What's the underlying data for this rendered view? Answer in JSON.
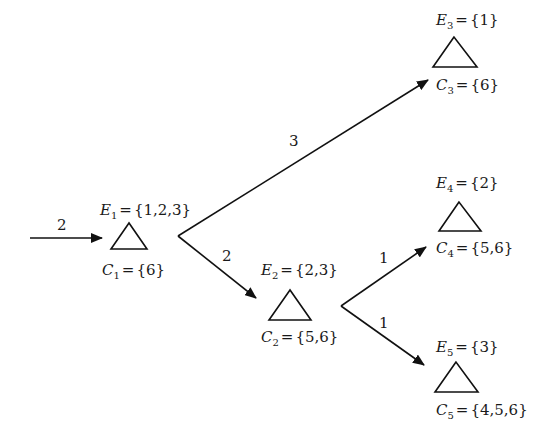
{
  "diagram": {
    "type": "tree",
    "input_edge": {
      "label": "2"
    },
    "nodes": [
      {
        "id": "n1",
        "E_var": "E",
        "E_sub": "1",
        "E_set": "{1,2,3}",
        "C_var": "C",
        "C_sub": "1",
        "C_set": "{6}"
      },
      {
        "id": "n2",
        "E_var": "E",
        "E_sub": "2",
        "E_set": "{2,3}",
        "C_var": "C",
        "C_sub": "2",
        "C_set": "{5,6}"
      },
      {
        "id": "n3",
        "E_var": "E",
        "E_sub": "3",
        "E_set": "{1}",
        "C_var": "C",
        "C_sub": "3",
        "C_set": "{6}"
      },
      {
        "id": "n4",
        "E_var": "E",
        "E_sub": "4",
        "E_set": "{2}",
        "C_var": "C",
        "C_sub": "4",
        "C_set": "{5,6}"
      },
      {
        "id": "n5",
        "E_var": "E",
        "E_sub": "5",
        "E_set": "{3}",
        "C_var": "C",
        "C_sub": "5",
        "C_set": "{4,5,6}"
      }
    ],
    "edges": [
      {
        "from": "n1",
        "to": "n3",
        "label": "3"
      },
      {
        "from": "n1",
        "to": "n2",
        "label": "2"
      },
      {
        "from": "n2",
        "to": "n4",
        "label": "1"
      },
      {
        "from": "n2",
        "to": "n5",
        "label": "1"
      }
    ],
    "eq": "="
  }
}
